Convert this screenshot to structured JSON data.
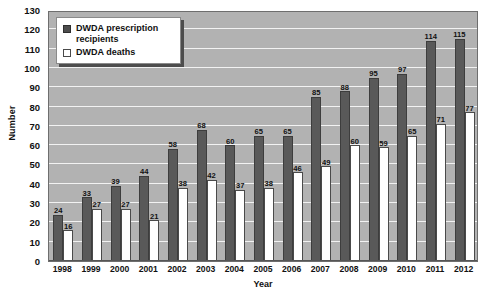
{
  "chart_data": {
    "type": "bar",
    "title": "",
    "subtitle": "",
    "xlabel": "Year",
    "ylabel": "Number",
    "categories": [
      "1998",
      "1999",
      "2000",
      "2001",
      "2002",
      "2003",
      "2004",
      "2005",
      "2006",
      "2007",
      "2008",
      "2009",
      "2010",
      "2011",
      "2012"
    ],
    "series": [
      {
        "name": "DWDA prescription recipients",
        "color": "#595959",
        "values": [
          24,
          33,
          39,
          44,
          58,
          68,
          60,
          65,
          65,
          85,
          88,
          95,
          97,
          114,
          115
        ]
      },
      {
        "name": "DWDA deaths",
        "color": "#ffffff",
        "values": [
          16,
          27,
          27,
          21,
          38,
          42,
          37,
          38,
          46,
          49,
          60,
          59,
          65,
          71,
          77
        ]
      }
    ],
    "ylim": [
      0,
      130
    ],
    "ytick_step": 10,
    "yticks": [
      0,
      10,
      20,
      30,
      40,
      50,
      60,
      70,
      80,
      90,
      100,
      110,
      120,
      130
    ],
    "grid": true,
    "grid_axis": "y",
    "legend_position": "top-left",
    "data_labels": true,
    "plot_background": "#b2b2b2",
    "gridline_color": "#f2f2f2"
  },
  "legend": {
    "items": [
      {
        "label": "DWDA prescription recipients",
        "marker": "filled-square-dark"
      },
      {
        "label": "DWDA deaths",
        "marker": "empty-square-light"
      }
    ]
  },
  "axes": {
    "y_title": "Number",
    "x_title": "Year"
  }
}
